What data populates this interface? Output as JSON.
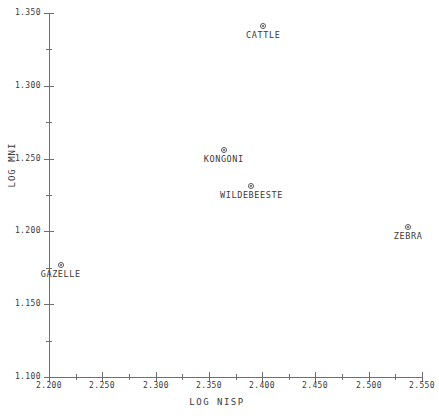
{
  "chart_data": {
    "type": "scatter",
    "title": "",
    "xlabel": "LOG NISP",
    "ylabel": "LOG MNI",
    "xlim": [
      2.2,
      2.55
    ],
    "ylim": [
      1.1,
      1.35
    ],
    "x_major_step": 0.05,
    "x_minor_step": 0.025,
    "y_major_step": 0.05,
    "y_minor_step": 0.025,
    "grid": false,
    "legend": null,
    "xticklabels": [
      "2.200",
      "2.250",
      "2.300",
      "2.350",
      "2.400",
      "2.450",
      "2.500",
      "2.550"
    ],
    "xtickvalues": [
      2.2,
      2.25,
      2.3,
      2.35,
      2.4,
      2.45,
      2.5,
      2.55
    ],
    "yticklabels": [
      "1.350",
      "1.300",
      "1.250",
      "1.200",
      "1.150",
      "1.100"
    ],
    "ytickvalues": [
      1.35,
      1.3,
      1.25,
      1.2,
      1.15,
      1.1
    ],
    "x_minor_ticks": [
      2.225,
      2.275,
      2.325,
      2.375,
      2.425,
      2.475,
      2.525
    ],
    "y_minor_ticks": [
      1.325,
      1.275,
      1.225,
      1.175,
      1.125
    ],
    "marker": "circle-dot",
    "points": [
      {
        "label": "CATTLE",
        "x": 2.401,
        "y": 1.341
      },
      {
        "label": "KONGONI",
        "x": 2.364,
        "y": 1.256
      },
      {
        "label": "WILDEBEESTE",
        "x": 2.39,
        "y": 1.231
      },
      {
        "label": "ZEBRA",
        "x": 2.537,
        "y": 1.203
      },
      {
        "label": "GAZELLE",
        "x": 2.211,
        "y": 1.177
      }
    ]
  },
  "colors": {
    "background": "#ffffff",
    "axis": "#6f6f6f",
    "text": "#3a3a3a",
    "marker": "#555555"
  }
}
